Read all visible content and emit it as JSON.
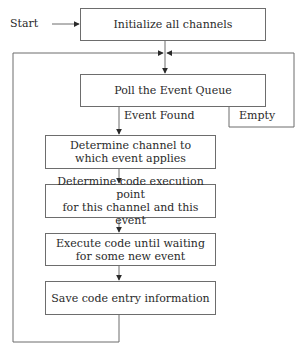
{
  "diagram": {
    "start_label": "Start",
    "nodes": [
      {
        "id": "init",
        "label": "Initialize all channels"
      },
      {
        "id": "poll",
        "label": "Poll the Event Queue"
      },
      {
        "id": "determine_channel",
        "label": "Determine channel to which event applies",
        "line1": "Determine channel to",
        "line2": "which event applies"
      },
      {
        "id": "determine_point",
        "label": "Determine code execution point for this channel and this event",
        "line1": "Determine code execution point",
        "line2": "for this channel and this event"
      },
      {
        "id": "execute",
        "label": "Execute code until waiting for some new event",
        "line1": "Execute code until waiting",
        "line2": "for some new event"
      },
      {
        "id": "save",
        "label": "Save code entry information"
      }
    ],
    "edge_labels": {
      "event_found": "Event Found",
      "empty": "Empty"
    },
    "edges": [
      {
        "from": "start",
        "to": "init"
      },
      {
        "from": "init",
        "to": "poll"
      },
      {
        "from": "poll",
        "to": "determine_channel",
        "label": "Event Found"
      },
      {
        "from": "poll",
        "to": "poll",
        "label": "Empty"
      },
      {
        "from": "determine_channel",
        "to": "determine_point"
      },
      {
        "from": "determine_point",
        "to": "execute"
      },
      {
        "from": "execute",
        "to": "save"
      },
      {
        "from": "save",
        "to": "poll"
      }
    ]
  }
}
